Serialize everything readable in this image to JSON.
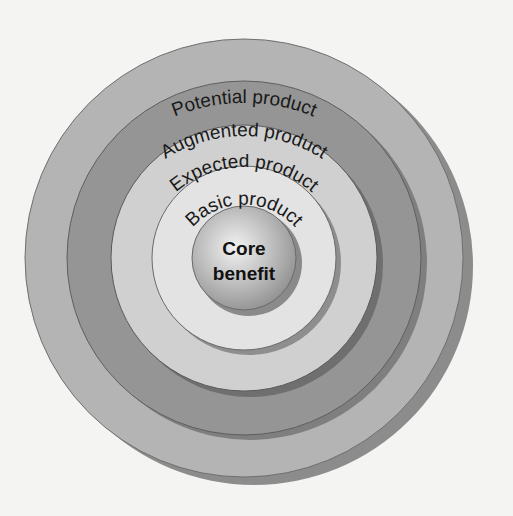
{
  "diagram": {
    "type": "concentric-levels",
    "title": "",
    "levels": [
      {
        "name": "potential",
        "label": "Potential product",
        "color": "#b4b4b4",
        "shadow": "#8c8c8c"
      },
      {
        "name": "augmented",
        "label": "Augmented product",
        "color": "#959595",
        "shadow": "#7a7a7a"
      },
      {
        "name": "expected",
        "label": "Expected product",
        "color": "#d0d0d0",
        "shadow": "#858585"
      },
      {
        "name": "basic",
        "label": "Basic product",
        "color": "#e3e3e3",
        "shadow": "#9a9a9a"
      }
    ],
    "core": {
      "line1": "Core",
      "line2": "benefit",
      "color_light": "#eeeeee",
      "color_dark": "#8a8a8a"
    },
    "background": "#f4f4f2"
  }
}
